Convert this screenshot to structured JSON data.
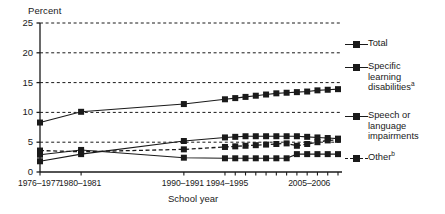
{
  "chart_data": {
    "type": "line",
    "title": "",
    "xlabel": "School year",
    "ylabel": "Percent",
    "ylim": [
      0,
      25
    ],
    "yticks": [
      0,
      5,
      10,
      15,
      20,
      25
    ],
    "ytick_labels": [
      "0",
      "5",
      "10",
      "15",
      "20",
      "25"
    ],
    "grid": "horizontal-dashed",
    "legend_position": "right",
    "x": [
      "1976-1977",
      "1980-1981",
      "1990-1991",
      "1994-1995",
      "1995-1996",
      "1996-1997",
      "1997-1998",
      "1998-1999",
      "1999-2000",
      "2000-2001",
      "2001-2002",
      "2002-2003",
      "2003-2004",
      "2004-2005",
      "2005-2006"
    ],
    "xtick_labels": [
      "1976–1977",
      "1980–1981",
      "1990–1991",
      "1994–1995",
      "2005–2006"
    ],
    "series": [
      {
        "name": "Total",
        "style": "solid",
        "marker": "square",
        "values": [
          8.3,
          10.1,
          11.4,
          12.2,
          12.4,
          12.6,
          12.8,
          13.0,
          13.2,
          13.3,
          13.4,
          13.5,
          13.7,
          13.8,
          13.9
        ]
      },
      {
        "name": "Specific learning disabilities",
        "footnote": "a",
        "style": "solid",
        "marker": "square",
        "values": [
          1.8,
          3.0,
          5.2,
          5.8,
          5.9,
          6.0,
          6.0,
          6.0,
          6.0,
          6.0,
          6.0,
          5.9,
          5.8,
          5.7,
          5.6
        ]
      },
      {
        "name": "Speech or language impairments",
        "style": "solid",
        "marker": "square",
        "values": [
          2.9,
          3.7,
          2.4,
          2.3,
          2.3,
          2.3,
          2.3,
          2.3,
          2.3,
          2.3,
          3.0,
          3.0,
          3.0,
          3.0,
          3.0
        ]
      },
      {
        "name": "Other",
        "footnote": "b",
        "style": "dashed",
        "marker": "square",
        "values": [
          3.6,
          3.4,
          3.8,
          4.2,
          4.3,
          4.4,
          4.5,
          4.6,
          4.7,
          4.8,
          4.4,
          4.7,
          5.0,
          5.3,
          5.4
        ]
      }
    ]
  },
  "axis": {
    "ylabel_title": "Percent",
    "xlabel_title": "School year"
  },
  "legend": {
    "items": [
      {
        "label": "Total",
        "footnote": "",
        "dashed": false
      },
      {
        "label": "Specific\nlearning\ndisabilities",
        "footnote": "a",
        "dashed": false
      },
      {
        "label": "Speech or\nlanguage\nimpairments",
        "footnote": "",
        "dashed": false
      },
      {
        "label": "Other",
        "footnote": "b",
        "dashed": true
      }
    ]
  },
  "colors": {
    "ink": "#1a1a1a",
    "background": "#ffffff"
  }
}
